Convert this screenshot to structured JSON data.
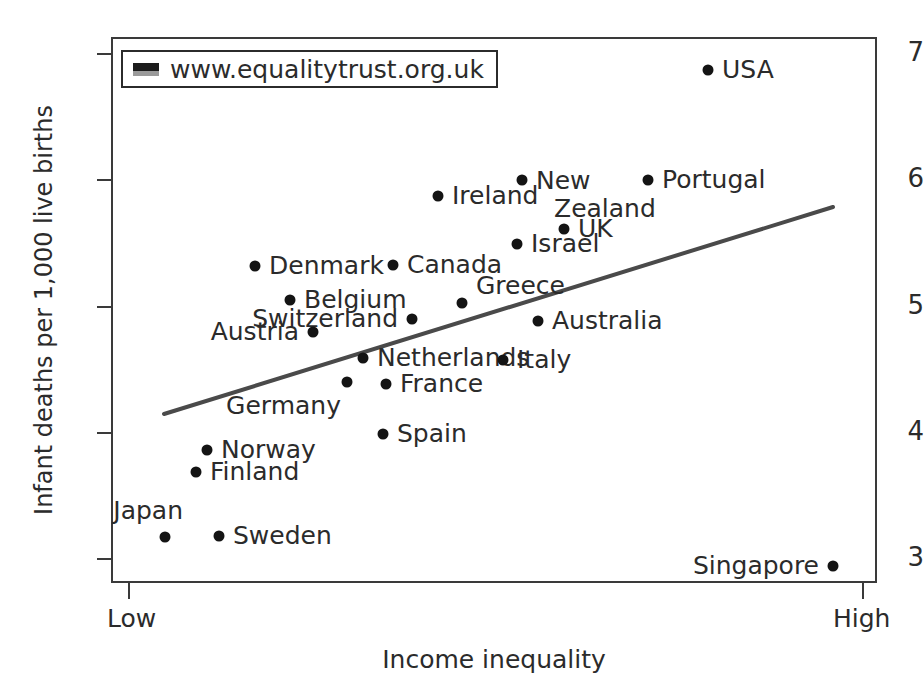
{
  "chart_data": {
    "type": "scatter",
    "title": "",
    "xlabel": "Income inequality",
    "ylabel": "Infant deaths per 1,000 live births",
    "x_tick_labels": [
      "Low",
      "High"
    ],
    "y_tick_labels": [
      "3",
      "4",
      "5",
      "6",
      "7"
    ],
    "y_ticks": [
      3,
      4,
      5,
      6,
      7
    ],
    "ylim": [
      2.8,
      7.2
    ],
    "grid": false,
    "legend": {
      "position": "top-left-inside",
      "entries": [
        {
          "label": "www.equalitytrust.org.uk",
          "swatch": "dark-gray-bar"
        }
      ]
    },
    "annotations": [
      {
        "name": "trend-line",
        "type": "line-of-best-fit",
        "color": "#4a4a4a",
        "x_start_px": 164,
        "y_start_px": 414,
        "x_end_px": 833,
        "y_end_px": 207
      }
    ],
    "points": [
      {
        "label": "USA",
        "x_px": 708,
        "y_px": 70,
        "y_value": 6.85,
        "x_rank": 0.79,
        "label_pos": "right"
      },
      {
        "label": "Portugal",
        "x_px": 648,
        "y_px": 180,
        "y_value": 6.0,
        "x_rank": 0.71,
        "label_pos": "right"
      },
      {
        "label": "New Zealand",
        "x_px": 522,
        "y_px": 180,
        "y_value": 6.0,
        "x_rank": 0.54,
        "label_pos": "right",
        "lines": [
          "New",
          "Zealand"
        ]
      },
      {
        "label": "Ireland",
        "x_px": 438,
        "y_px": 196,
        "y_value": 5.9,
        "x_rank": 0.42,
        "label_pos": "right"
      },
      {
        "label": "UK",
        "x_px": 564,
        "y_px": 229,
        "y_value": 5.6,
        "x_rank": 0.59,
        "label_pos": "right"
      },
      {
        "label": "Israel",
        "x_px": 517,
        "y_px": 244,
        "y_value": 5.47,
        "x_rank": 0.53,
        "label_pos": "right"
      },
      {
        "label": "Denmark",
        "x_px": 255,
        "y_px": 266,
        "y_value": 5.3,
        "x_rank": 0.17,
        "label_pos": "right"
      },
      {
        "label": "Canada",
        "x_px": 393,
        "y_px": 265,
        "y_value": 5.3,
        "x_rank": 0.36,
        "label_pos": "right"
      },
      {
        "label": "Belgium",
        "x_px": 290,
        "y_px": 300,
        "y_value": 5.02,
        "x_rank": 0.22,
        "label_pos": "right"
      },
      {
        "label": "Greece",
        "x_px": 462,
        "y_px": 303,
        "y_value": 5.0,
        "x_rank": 0.46,
        "label_pos": "right-up"
      },
      {
        "label": "Switzerland",
        "x_px": 412,
        "y_px": 319,
        "y_value": 4.9,
        "x_rank": 0.39,
        "label_pos": "left"
      },
      {
        "label": "Australia",
        "x_px": 538,
        "y_px": 321,
        "y_value": 4.88,
        "x_rank": 0.58,
        "label_pos": "right"
      },
      {
        "label": "Austria",
        "x_px": 313,
        "y_px": 332,
        "y_value": 4.8,
        "x_rank": 0.25,
        "label_pos": "left"
      },
      {
        "label": "Netherlands",
        "x_px": 363,
        "y_px": 358,
        "y_value": 4.6,
        "x_rank": 0.32,
        "label_pos": "right"
      },
      {
        "label": "Italy",
        "x_px": 503,
        "y_px": 360,
        "y_value": 4.58,
        "x_rank": 0.53,
        "label_pos": "right"
      },
      {
        "label": "France",
        "x_px": 386,
        "y_px": 384,
        "y_value": 4.4,
        "x_rank": 0.35,
        "label_pos": "right"
      },
      {
        "label": "Germany",
        "x_px": 347,
        "y_px": 382,
        "y_value": 4.4,
        "x_rank": 0.3,
        "label_pos": "below-left"
      },
      {
        "label": "Spain",
        "x_px": 383,
        "y_px": 434,
        "y_value": 4.0,
        "x_rank": 0.35,
        "label_pos": "right"
      },
      {
        "label": "Norway",
        "x_px": 207,
        "y_px": 450,
        "y_value": 3.84,
        "x_rank": 0.11,
        "label_pos": "right"
      },
      {
        "label": "Finland",
        "x_px": 196,
        "y_px": 472,
        "y_value": 3.68,
        "x_rank": 0.09,
        "label_pos": "right"
      },
      {
        "label": "Japan",
        "x_px": 165,
        "y_px": 537,
        "y_value": 3.2,
        "x_rank": 0.05,
        "label_pos": "above-left"
      },
      {
        "label": "Sweden",
        "x_px": 219,
        "y_px": 536,
        "y_value": 3.2,
        "x_rank": 0.12,
        "label_pos": "right"
      },
      {
        "label": "Singapore",
        "x_px": 833,
        "y_px": 566,
        "y_value": 2.9,
        "x_rank": 0.96,
        "label_pos": "left"
      }
    ]
  },
  "axis": {
    "y_title": "Infant deaths per 1,000 live births",
    "x_title": "Income inequality",
    "y_labels": [
      "7",
      "6",
      "5",
      "4",
      "3"
    ],
    "x_low_label": "Low",
    "x_high_label": "High"
  },
  "legend": {
    "label": "www.equalitytrust.org.uk"
  },
  "colors": {
    "point": "#141414",
    "trend_line": "#4a4a4a",
    "frame": "#3a3a3a",
    "text": "#2b2b2b",
    "background": "#ffffff"
  }
}
